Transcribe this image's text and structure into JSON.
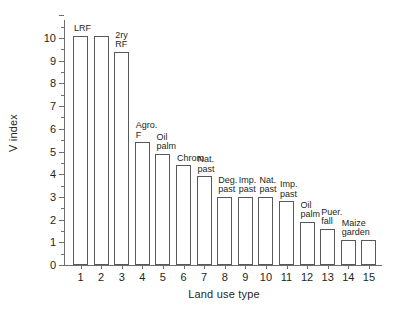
{
  "chart_data": {
    "type": "bar",
    "title": "",
    "xlabel": "Land use type",
    "ylabel": "V index",
    "ylim": [
      0,
      11
    ],
    "yticks": [
      0,
      1,
      2,
      3,
      4,
      5,
      6,
      7,
      8,
      9,
      10
    ],
    "ytick_labels": [
      "0",
      "1",
      "2",
      "3",
      "4",
      "5",
      "6",
      "7",
      "8",
      "9",
      "10"
    ],
    "grid": false,
    "legend": "none",
    "categories": [
      "1",
      "2",
      "3",
      "4",
      "5",
      "6",
      "7",
      "8",
      "9",
      "10",
      "11",
      "12",
      "13",
      "14",
      "15"
    ],
    "values": [
      10.1,
      10.1,
      9.4,
      5.4,
      4.9,
      4.4,
      3.9,
      3.0,
      3.0,
      3.0,
      2.8,
      1.9,
      1.6,
      1.1,
      1.1
    ],
    "point_labels": [
      "LRF",
      "",
      "2ry\nRF",
      "Agro.\nF",
      "Oil\npalm",
      "Chrom",
      "Nat.\npast",
      "Deg.\npast",
      "Imp.\npast",
      "Nat.\npast",
      "Imp.\npast",
      "Oil\npalm",
      "Puer.\nfall",
      "Maize\ngarden",
      ""
    ],
    "bar_fill_color": "#ffffff",
    "bar_edge_color": "#58595b",
    "axis_color": "#6d6e71",
    "text_color": "#231f20",
    "background_color": "#ffffff"
  }
}
